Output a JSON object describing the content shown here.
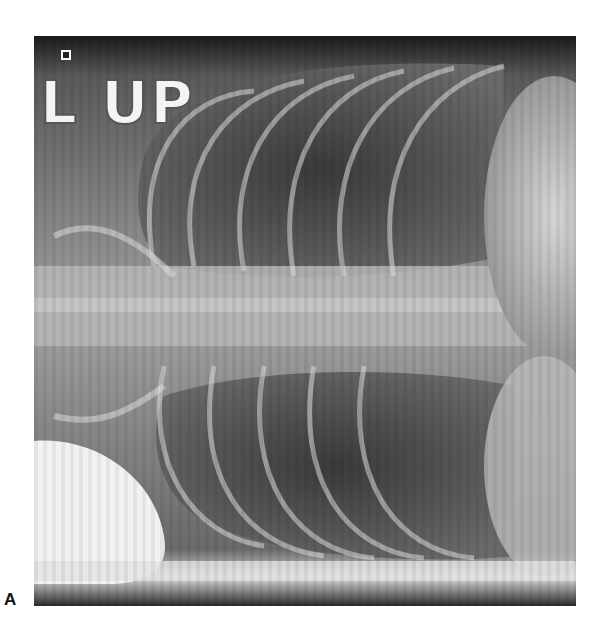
{
  "figure": {
    "panel_label": "A",
    "image_type": "chest radiograph",
    "marker_text": "L UP"
  }
}
